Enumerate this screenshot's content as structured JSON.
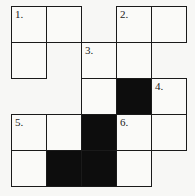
{
  "puzzle": {
    "type": "crossword",
    "rows": 5,
    "cols": 5,
    "cells": [
      {
        "r": 0,
        "c": 0,
        "num": "1.",
        "black": false
      },
      {
        "r": 0,
        "c": 1,
        "num": "",
        "black": false
      },
      {
        "r": 0,
        "c": 3,
        "num": "2.",
        "black": false
      },
      {
        "r": 0,
        "c": 4,
        "num": "",
        "black": false
      },
      {
        "r": 1,
        "c": 0,
        "num": "",
        "black": false
      },
      {
        "r": 1,
        "c": 2,
        "num": "3.",
        "black": false
      },
      {
        "r": 1,
        "c": 3,
        "num": "",
        "black": false
      },
      {
        "r": 2,
        "c": 2,
        "num": "",
        "black": false
      },
      {
        "r": 2,
        "c": 3,
        "num": "",
        "black": true
      },
      {
        "r": 2,
        "c": 4,
        "num": "4.",
        "black": false
      },
      {
        "r": 3,
        "c": 0,
        "num": "5.",
        "black": false
      },
      {
        "r": 3,
        "c": 1,
        "num": "",
        "black": false
      },
      {
        "r": 3,
        "c": 2,
        "num": "",
        "black": true
      },
      {
        "r": 3,
        "c": 3,
        "num": "6.",
        "black": false
      },
      {
        "r": 3,
        "c": 4,
        "num": "",
        "black": false
      },
      {
        "r": 4,
        "c": 0,
        "num": "",
        "black": false
      },
      {
        "r": 4,
        "c": 1,
        "num": "",
        "black": true
      },
      {
        "r": 4,
        "c": 2,
        "num": "",
        "black": true
      },
      {
        "r": 4,
        "c": 3,
        "num": "",
        "black": false
      }
    ]
  },
  "colors": {
    "line": "#1a1a1a",
    "black_cell": "#0d0d0d",
    "white_cell": "#fafaf8"
  }
}
